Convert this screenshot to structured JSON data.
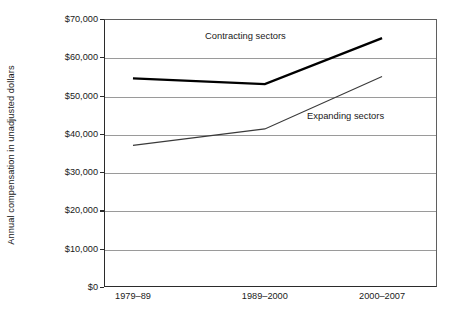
{
  "chart_data": {
    "type": "line",
    "title": "",
    "subtitle": "",
    "xlabel": "",
    "ylabel": "Annual compensation in unadjusted dollars",
    "categories": [
      "1979–89",
      "1989–2000",
      "2000–2007"
    ],
    "series": [
      {
        "name": "Contracting sectors",
        "values": [
          54500,
          53000,
          65000
        ],
        "color": "#000000",
        "line_width": 2.4
      },
      {
        "name": "Expanding sectors",
        "values": [
          37000,
          41300,
          55000
        ],
        "color": "#3a3a3a",
        "line_width": 1.1
      }
    ],
    "ylim": [
      0,
      70000
    ],
    "ytick_values": [
      70000,
      60000,
      50000,
      40000,
      30000,
      20000,
      10000,
      0
    ],
    "ytick_labels": [
      "$70,000",
      "$60,000",
      "$50,000",
      "$40,000",
      "$30,000",
      "$20,000",
      "$10,000",
      "$0"
    ],
    "grid": true,
    "grid_axis": "y",
    "grid_color": "#9a9a9a",
    "legend": "inline-annotations",
    "legend_position": "inside-plot",
    "annotations": [
      {
        "text": "Contracting sectors",
        "x_px": 205,
        "y_px": 30
      },
      {
        "text": "Expanding sectors",
        "x_px": 307,
        "y_px": 110
      }
    ],
    "axis_color": "#2b2b2b",
    "background": "#ffffff",
    "category_x_fractions": [
      0.087,
      0.483,
      0.835
    ]
  }
}
